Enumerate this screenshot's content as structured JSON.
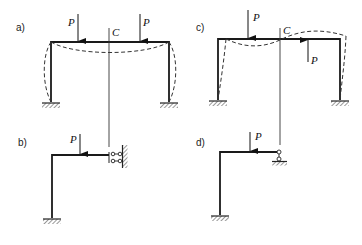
{
  "figure": {
    "panels": [
      {
        "id": "a",
        "label": "a)",
        "loads": [
          "P",
          "P"
        ],
        "axis_label": "C",
        "description": "Symmetric portal frame with two symmetric downward loads P; dashed symmetric deflected shape; symmetry axis C"
      },
      {
        "id": "b",
        "label": "b)",
        "loads": [
          "P"
        ],
        "description": "Half-frame for symmetric loading: fixed base column, beam with downward P, sliding (double-link) support at symmetry axis"
      },
      {
        "id": "c",
        "label": "c)",
        "loads": [
          "P",
          "P"
        ],
        "axis_label": "C",
        "description": "Portal frame with antisymmetric loads (P down left, P up right); dashed antisymmetric deflected shape; symmetry axis C"
      },
      {
        "id": "d",
        "label": "d)",
        "loads": [
          "P"
        ],
        "description": "Half-frame for antisymmetric loading: fixed base column, beam with downward P, roller support at symmetry axis"
      }
    ]
  },
  "colors": {
    "line": "#1a1a1a",
    "background": "#ffffff"
  }
}
